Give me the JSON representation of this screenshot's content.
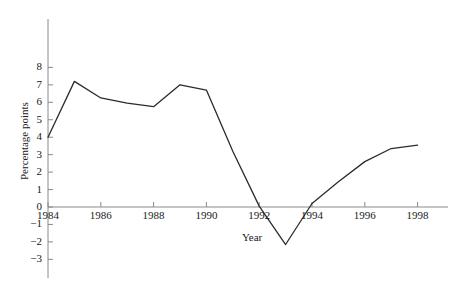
{
  "chart_data": {
    "type": "line",
    "title": "",
    "xlabel": "Year",
    "ylabel": "Percentage points",
    "x": [
      1984,
      1985,
      1986,
      1987,
      1988,
      1989,
      1990,
      1991,
      1992,
      1993,
      1994,
      1995,
      1996,
      1997,
      1998
    ],
    "values": [
      4.0,
      7.2,
      6.25,
      5.95,
      5.75,
      7.0,
      6.7,
      3.2,
      0.05,
      -2.15,
      0.2,
      1.45,
      2.6,
      3.35,
      3.55
    ],
    "series": [
      {
        "name": "Percentage points",
        "values": [
          4.0,
          7.2,
          6.25,
          5.95,
          5.75,
          7.0,
          6.7,
          3.2,
          0.05,
          -2.15,
          0.2,
          1.45,
          2.6,
          3.35,
          3.55
        ]
      }
    ],
    "xlim": [
      1983.4,
      1999.0
    ],
    "ylim": [
      -3,
      8
    ],
    "xticks": [
      1984,
      1986,
      1988,
      1990,
      1992,
      1994,
      1996,
      1998
    ],
    "xtick_labels": [
      "1984",
      "1986",
      "1988",
      "1990",
      "1992",
      "1994",
      "1996",
      "1998"
    ],
    "yticks": [
      -3,
      -2,
      -1,
      0,
      1,
      2,
      3,
      4,
      5,
      6,
      7,
      8
    ],
    "ytick_labels": [
      "−3",
      "−2",
      "−1",
      "0",
      "1",
      "2",
      "3",
      "4",
      "5",
      "6",
      "7",
      "8"
    ],
    "grid": false,
    "legend": false,
    "legend_position": "none",
    "line_color": "#2b2b2b",
    "axis_color": "#8a8a8a",
    "zero_line_value": 0,
    "background_color": "#ffffff"
  }
}
